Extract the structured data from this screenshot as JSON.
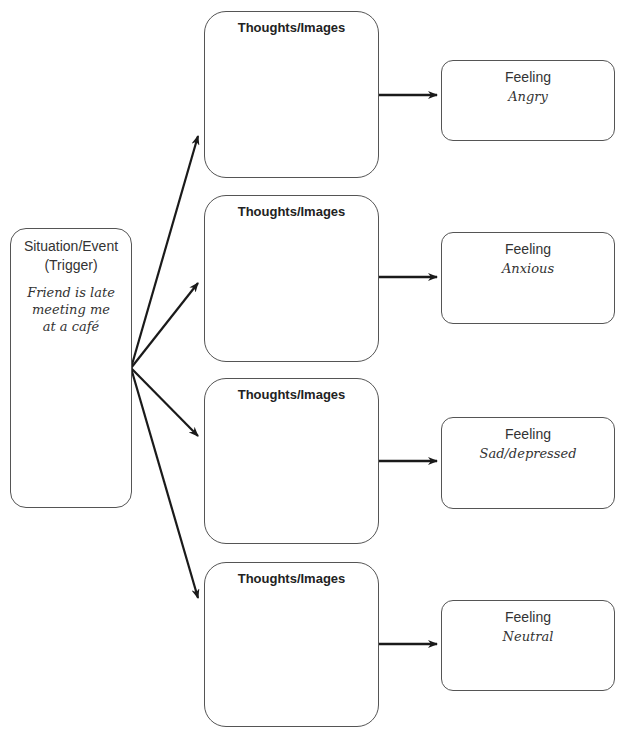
{
  "situation": {
    "title_line1": "Situation/Event",
    "title_line2": "(Trigger)",
    "detail_line1": "Friend is late",
    "detail_line2": "meeting me",
    "detail_line3": "at a café"
  },
  "thoughts": [
    {
      "label": "Thoughts/Images",
      "content": ""
    },
    {
      "label": "Thoughts/Images",
      "content": ""
    },
    {
      "label": "Thoughts/Images",
      "content": ""
    },
    {
      "label": "Thoughts/Images",
      "content": ""
    }
  ],
  "feelings": [
    {
      "label": "Feeling",
      "value": "Angry"
    },
    {
      "label": "Feeling",
      "value": "Anxious"
    },
    {
      "label": "Feeling",
      "value": "Sad/depressed"
    },
    {
      "label": "Feeling",
      "value": "Neutral"
    }
  ],
  "colors": {
    "border": "#555555",
    "arrow": "#1a1a1a",
    "background": "#ffffff"
  }
}
